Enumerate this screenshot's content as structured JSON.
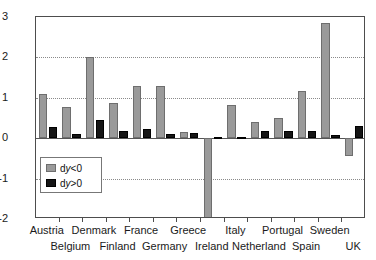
{
  "chart_data": {
    "type": "bar",
    "title": "",
    "subtitle": "",
    "xlabel": "",
    "ylabel": "",
    "ylim": [
      -2,
      3
    ],
    "yticks": [
      3,
      2,
      1,
      0,
      -1,
      -2
    ],
    "ytick_labels": [
      "3",
      "2",
      "1",
      "0",
      "-1",
      "-2"
    ],
    "grid": true,
    "gridlines_at": [
      2,
      1,
      -1
    ],
    "legend_position": "lower-left-inside",
    "categories": [
      "Austria",
      "Belgium",
      "Denmark",
      "Finland",
      "France",
      "Germany",
      "Greece",
      "Ireland",
      "Italy",
      "Netherland",
      "Portugal",
      "Spain",
      "Sweden",
      "UK"
    ],
    "series": [
      {
        "name": "dy<0",
        "color": "#9a9a9a",
        "values": [
          1.1,
          0.78,
          2.02,
          0.86,
          1.28,
          1.29,
          0.16,
          -2.35,
          0.81,
          0.39,
          0.49,
          1.16,
          2.86,
          -0.45
        ]
      },
      {
        "name": "dy>0",
        "color": "#151515",
        "values": [
          0.27,
          0.11,
          0.46,
          0.18,
          0.23,
          0.11,
          0.14,
          0.03,
          0.02,
          0.19,
          0.19,
          0.19,
          0.07,
          0.29
        ]
      }
    ]
  },
  "legend": {
    "entries": [
      {
        "label_prefix": "d",
        "label_var": "y",
        "label_suffix": "<0",
        "full": "dy<0",
        "swatch": "gray-swatch"
      },
      {
        "label_prefix": "d",
        "label_var": "y",
        "label_suffix": ">0",
        "full": "dy>0",
        "swatch": "black-swatch"
      }
    ]
  },
  "axis": {
    "y_tick_labels": [
      "3",
      "2",
      "1",
      "0",
      "-1",
      "-2"
    ],
    "x_labels_row_top": [
      "Austria",
      "Denmark",
      "France",
      "Greece",
      "Italy",
      "Portugal",
      "Sweden"
    ],
    "x_labels_row_bottom": [
      "Belgium",
      "Finland",
      "Germany",
      "Ireland",
      "Netherland",
      "Spain",
      "UK"
    ]
  }
}
